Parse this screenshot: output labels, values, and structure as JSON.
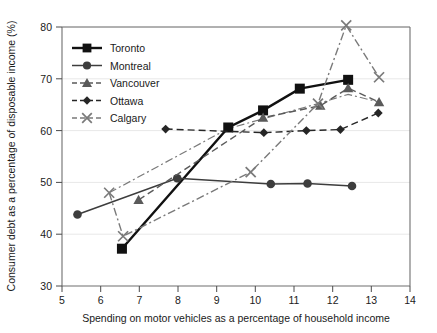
{
  "chart_data": {
    "type": "line",
    "title": "",
    "xlabel": "Spending on motor vehicles as a percentage of household income",
    "ylabel": "Consumer debt as a percentage of disposable income (%)",
    "xlim": [
      5,
      14
    ],
    "ylim": [
      30,
      80
    ],
    "xticks": [
      5,
      6,
      7,
      8,
      9,
      10,
      11,
      12,
      13,
      14
    ],
    "yticks": [
      30,
      40,
      50,
      60,
      70,
      80
    ],
    "grid": "horizontal-faint",
    "legend_position": "top-left-inside",
    "series": [
      {
        "name": "Toronto",
        "marker": "square",
        "line": "solid",
        "color": "#111111",
        "points": [
          {
            "x": 6.55,
            "y": 37.2
          },
          {
            "x": 9.3,
            "y": 60.6
          },
          {
            "x": 10.2,
            "y": 63.9
          },
          {
            "x": 11.15,
            "y": 68.1
          },
          {
            "x": 12.4,
            "y": 69.8
          }
        ]
      },
      {
        "name": "Montreal",
        "marker": "circle",
        "line": "solid",
        "color": "#3d3d3d",
        "points": [
          {
            "x": 5.4,
            "y": 43.8
          },
          {
            "x": 7.98,
            "y": 50.8
          },
          {
            "x": 10.4,
            "y": 49.7
          },
          {
            "x": 11.35,
            "y": 49.8
          },
          {
            "x": 12.5,
            "y": 49.3
          }
        ]
      },
      {
        "name": "Vancouver",
        "marker": "triangle",
        "line": "dashed",
        "color": "#5a5a5a",
        "points": [
          {
            "x": 6.98,
            "y": 46.6
          },
          {
            "x": 10.2,
            "y": 62.5
          },
          {
            "x": 11.68,
            "y": 64.8
          },
          {
            "x": 12.4,
            "y": 68.2
          },
          {
            "x": 13.2,
            "y": 65.5
          }
        ]
      },
      {
        "name": "Ottawa",
        "marker": "diamond",
        "line": "dashed",
        "color": "#262626",
        "points": [
          {
            "x": 7.68,
            "y": 60.3
          },
          {
            "x": 10.22,
            "y": 59.6
          },
          {
            "x": 11.32,
            "y": 60.0
          },
          {
            "x": 12.2,
            "y": 60.2
          },
          {
            "x": 13.18,
            "y": 63.4
          }
        ]
      },
      {
        "name": "Calgary",
        "marker": "x",
        "line": "dash-dot",
        "color": "#7a7a7a",
        "points": [
          {
            "x": 6.22,
            "y": 48.0
          },
          {
            "x": 6.58,
            "y": 39.6
          },
          {
            "x": 9.88,
            "y": 52.0
          },
          {
            "x": 11.62,
            "y": 65.2
          },
          {
            "x": 12.35,
            "y": 80.3
          },
          {
            "x": 13.2,
            "y": 70.3
          }
        ]
      }
    ],
    "extra_paths": [
      {
        "name": "calgary-upper-dashdot",
        "series": "Calgary",
        "points": [
          {
            "x": 6.22,
            "y": 48.0
          },
          {
            "x": 9.3,
            "y": 60.4
          },
          {
            "x": 11.62,
            "y": 65.2
          },
          {
            "x": 12.4,
            "y": 67.0
          },
          {
            "x": 13.2,
            "y": 65.5
          }
        ]
      }
    ]
  },
  "legend": {
    "items": [
      {
        "label": "Toronto"
      },
      {
        "label": "Montreal"
      },
      {
        "label": "Vancouver"
      },
      {
        "label": "Ottawa"
      },
      {
        "label": "Calgary"
      }
    ]
  },
  "axes": {
    "x_tick_labels": [
      "5",
      "6",
      "7",
      "8",
      "9",
      "10",
      "11",
      "12",
      "13",
      "14"
    ],
    "y_tick_labels": [
      "30",
      "40",
      "50",
      "60",
      "70",
      "80"
    ],
    "x_axis_title": "Spending on motor vehicles as a percentage of household income",
    "y_axis_title": "Consumer debt as a percentage of disposable income (%)"
  }
}
